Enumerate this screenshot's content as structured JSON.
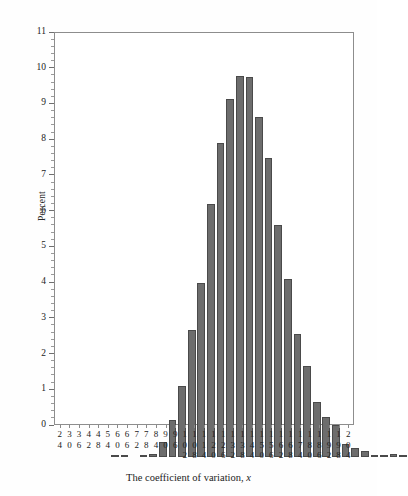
{
  "figure": {
    "background_color": "#ffffff",
    "bar_color": "#6d6d6d",
    "bar_border_color": "#4a4a4a",
    "axis_color": "#8d8d8d"
  },
  "axis": {
    "y_title": "Percent",
    "x_title_prefix": "The coefficient of variation, ",
    "x_title_variable": "x"
  },
  "chart_data": {
    "type": "bar",
    "title": "",
    "subtitle": "",
    "xlabel": "The coefficient of variation, x",
    "ylabel": "Percent",
    "ylim": [
      0,
      11
    ],
    "xlim": [
      21,
      207
    ],
    "bin_width": 6,
    "grid": false,
    "legend": null,
    "y_ticks_major": [
      0,
      1,
      2,
      3,
      4,
      5,
      6,
      7,
      8,
      9,
      10,
      11
    ],
    "y_tick_labels": [
      "0",
      "1",
      "2",
      "3",
      "4",
      "5",
      "6",
      "7",
      "8",
      "9",
      "10",
      "11"
    ],
    "y_minor_tick_step": 0.2,
    "categories": [
      "24",
      "30",
      "36",
      "42",
      "48",
      "54",
      "60",
      "66",
      "72",
      "78",
      "84",
      "90",
      "96",
      "102",
      "108",
      "114",
      "120",
      "126",
      "132",
      "138",
      "144",
      "150",
      "156",
      "162",
      "168",
      "174",
      "180",
      "186",
      "192",
      "198",
      "204"
    ],
    "values": [
      0.04,
      0.02,
      0.0,
      0.03,
      0.09,
      0.42,
      1.05,
      2.01,
      3.57,
      4.89,
      7.12,
      8.83,
      10.07,
      10.72,
      10.7,
      9.57,
      8.41,
      6.52,
      5.0,
      3.45,
      2.57,
      1.56,
      1.12,
      0.91,
      0.37,
      0.26,
      0.16,
      0.05,
      0.04,
      0.08,
      0.03
    ],
    "value_unit": "percent"
  }
}
